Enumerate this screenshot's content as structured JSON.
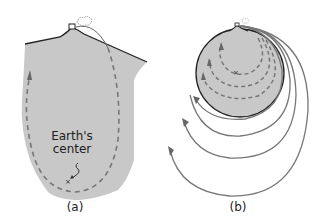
{
  "panels": [
    {
      "id": "a",
      "caption": "(a)",
      "label_line1": "Earth's",
      "label_line2": "center",
      "description": "Cross-section wedge of Earth with a cannon on a mountain; dashed elliptical path through the interior"
    },
    {
      "id": "b",
      "caption": "(b)",
      "description": "Whole Earth with cannon on mountain; dashed paths inside, solid orbits outside"
    }
  ],
  "colors": {
    "earth_fill": "#c8c8c8",
    "outline": "#333333",
    "path": "#7a7a7a",
    "arrow": "#6a6a6a"
  }
}
